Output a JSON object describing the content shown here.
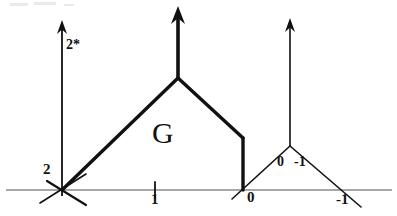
{
  "figure": {
    "background_color": "#ffffff",
    "ink_color": "#111111",
    "axis_color": "#8a8a8a",
    "width": 397,
    "height": 216
  },
  "axis": {
    "name": "horizontal-number-line",
    "y": 190,
    "x_start": 6,
    "x_end": 392,
    "ticks": [
      {
        "label": "2",
        "x": 62,
        "label_x": 43,
        "label_y": 170
      },
      {
        "label": "1",
        "x": 155,
        "label_x": 151,
        "label_y": 194
      },
      {
        "label": "0",
        "x": 243,
        "label_x": 247,
        "label_y": 193
      },
      {
        "label": "-1",
        "x": 345,
        "label_x": 336,
        "label_y": 194
      }
    ]
  },
  "labels": {
    "vertical_arrow_1": "2*",
    "region": "G",
    "small_left": "0",
    "small_right": "-1"
  },
  "label_positions": {
    "vertical_arrow_1": {
      "x": 64,
      "y": 42
    },
    "region": {
      "x": 152,
      "y": 122
    },
    "small_left": {
      "x": 279,
      "y": 160
    },
    "small_right": {
      "x": 293,
      "y": 160
    }
  },
  "arrows": [
    {
      "name": "vertical-arrow-left",
      "x": 62,
      "y_base": 196,
      "y_tip": 20,
      "stroke_width": 1.8,
      "head_width": 5,
      "head_length": 14
    },
    {
      "name": "vertical-arrow-center",
      "x": 178,
      "y_base": 78,
      "y_tip": 6,
      "stroke_width": 3.6,
      "head_width": 7,
      "head_length": 18
    },
    {
      "name": "vertical-arrow-right",
      "x": 290,
      "y_base": 146,
      "y_tip": 18,
      "stroke_width": 1.6,
      "head_width": 5,
      "head_length": 14
    }
  ],
  "chart_data": {
    "type": "line",
    "xlabel": "",
    "ylabel": "",
    "xlim": [
      6,
      392
    ],
    "ylim": [
      0,
      216
    ],
    "grid": false,
    "legend": false,
    "axis_tick_labels": [
      "2",
      "1",
      "0",
      "-1"
    ],
    "annotations": [
      "2*",
      "G",
      "0",
      "-1"
    ],
    "series": [
      {
        "name": "large-tent-left-slope",
        "stroke_width": 3.4,
        "points": [
          [
            62,
            190
          ],
          [
            178,
            78
          ]
        ]
      },
      {
        "name": "large-tent-right-slope",
        "stroke_width": 3.4,
        "points": [
          [
            178,
            78
          ],
          [
            243,
            138
          ]
        ]
      },
      {
        "name": "large-tent-vertical-drop",
        "stroke_width": 3.4,
        "points": [
          [
            243,
            138
          ],
          [
            243,
            190
          ]
        ]
      },
      {
        "name": "small-tent-left-slope",
        "stroke_width": 1.6,
        "points": [
          [
            232,
            199
          ],
          [
            290,
            146
          ]
        ]
      },
      {
        "name": "small-tent-right-slope",
        "stroke_width": 1.6,
        "points": [
          [
            290,
            146
          ],
          [
            361,
            207
          ]
        ]
      },
      {
        "name": "cross-mark-left-a",
        "stroke_width": 1.6,
        "points": [
          [
            40,
            203
          ],
          [
            86,
            174
          ]
        ]
      },
      {
        "name": "cross-mark-left-b",
        "stroke_width": 2.2,
        "points": [
          [
            47,
            181
          ],
          [
            86,
            205
          ]
        ]
      },
      {
        "name": "tick-mark-one",
        "stroke_width": 1.8,
        "points": [
          [
            155,
            182
          ],
          [
            155,
            198
          ]
        ]
      }
    ]
  },
  "noise_marks": [
    {
      "x": 10,
      "y": 3,
      "w": 18,
      "h": 3
    },
    {
      "x": 34,
      "y": 2,
      "w": 22,
      "h": 3
    },
    {
      "x": 64,
      "y": 4,
      "w": 10,
      "h": 2
    }
  ]
}
